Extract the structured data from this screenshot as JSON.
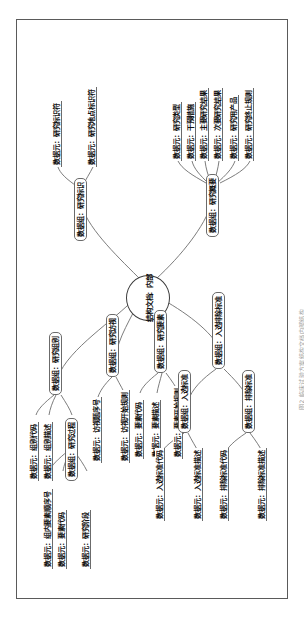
{
  "figure": {
    "caption": "图2  临床试验方案结构文档内部结构",
    "root_label": "结构文档：内部",
    "border_color": "#5a5a5a",
    "node_border_color": "#6b6b6b",
    "link_color": "#6d6d6d"
  },
  "branches": [
    {
      "id": "branch-study-group",
      "label": "数据组：研究组别",
      "children": [
        {
          "label": "数据元：组别代码",
          "type": "leaf"
        },
        {
          "label": "数据元：组别描述",
          "type": "leaf"
        },
        {
          "label": "数据组：研究过程",
          "type": "group",
          "children": [
            {
              "label": "数据元：组内要素顺序号",
              "type": "leaf"
            },
            {
              "label": "数据元：要素代码",
              "type": "leaf"
            },
            {
              "label": "数据元：研究阶段",
              "type": "leaf"
            }
          ]
        }
      ]
    },
    {
      "id": "branch-study-visit",
      "label": "数据组：研究访视",
      "children": [
        {
          "label": "数据元：访视题序号",
          "type": "leaf"
        },
        {
          "label": "数据元：访视开始规则",
          "type": "leaf"
        }
      ]
    },
    {
      "id": "branch-study-element",
      "label": "数据组：研究要素",
      "children": [
        {
          "label": "数据元：要素代码",
          "type": "leaf"
        },
        {
          "label": "数据元：要素描述",
          "type": "leaf"
        },
        {
          "label": "数据元：要素开始规则",
          "type": "leaf"
        }
      ]
    },
    {
      "id": "branch-inclusion-exclusion",
      "label": "数据组：入选排除标准",
      "children": [
        {
          "label": "数据组：入选标准",
          "type": "group",
          "children": [
            {
              "label": "数据元：入选标准代码",
              "type": "leaf"
            },
            {
              "label": "数据元：入选标准描述",
              "type": "leaf"
            }
          ]
        },
        {
          "label": "数据组：排除标准",
          "type": "group",
          "children": [
            {
              "label": "数据元：排除标准代码",
              "type": "leaf"
            },
            {
              "label": "数据元：排除标准描述",
              "type": "leaf"
            }
          ]
        }
      ]
    },
    {
      "id": "branch-study-identification",
      "label": "数据组：研究标识",
      "children": [
        {
          "label": "数据元：研究标识符",
          "type": "leaf"
        },
        {
          "label": "数据元：研究地点标识符",
          "type": "leaf"
        }
      ]
    },
    {
      "id": "branch-study-summary",
      "label": "数据组：研究概要",
      "children": [
        {
          "label": "数据元：研究类型",
          "type": "leaf"
        },
        {
          "label": "数据元：干预措施",
          "type": "leaf"
        },
        {
          "label": "数据元：主要研究结果",
          "type": "leaf"
        },
        {
          "label": "数据元：次要研究结果",
          "type": "leaf"
        },
        {
          "label": "数据元：研究用产品",
          "type": "leaf"
        },
        {
          "label": "数据元：研究终止规则",
          "type": "leaf"
        }
      ]
    }
  ]
}
